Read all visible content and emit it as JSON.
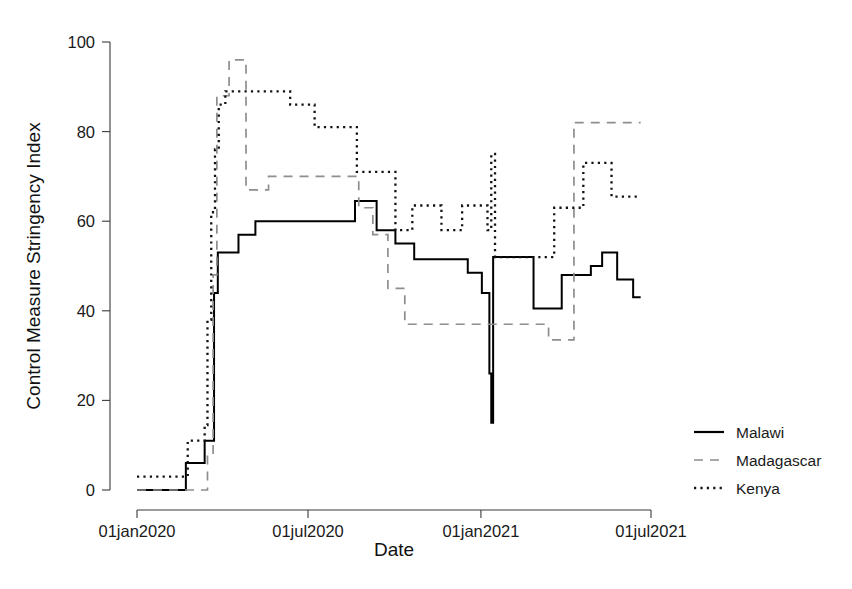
{
  "chart_data": {
    "type": "line",
    "title": "",
    "xlabel": "Date",
    "ylabel": "Control Measure Stringency Index",
    "grid": false,
    "legend_position": "right",
    "xlim": [
      "2020-01-01",
      "2021-07-01"
    ],
    "ylim": [
      0,
      100
    ],
    "xticks": [
      "01jan2020",
      "01jul2020",
      "01jan2021",
      "01jul2021"
    ],
    "xtick_values": [
      "2020-01-01",
      "2020-07-01",
      "2021-01-01",
      "2021-07-01"
    ],
    "yticks": [
      "0",
      "20",
      "40",
      "60",
      "80",
      "100"
    ],
    "ytick_values": [
      0,
      20,
      40,
      60,
      80,
      100
    ],
    "note": "Step (stairstep) lines; values are the index level held from each date until the next date.",
    "series": [
      {
        "name": "Malawi",
        "style": "solid",
        "color": "#000000",
        "points": [
          {
            "x": "2020-01-01",
            "y": 0
          },
          {
            "x": "2020-02-10",
            "y": 0
          },
          {
            "x": "2020-02-22",
            "y": 6
          },
          {
            "x": "2020-03-09",
            "y": 6
          },
          {
            "x": "2020-03-13",
            "y": 11
          },
          {
            "x": "2020-03-20",
            "y": 11
          },
          {
            "x": "2020-03-23",
            "y": 44
          },
          {
            "x": "2020-03-27",
            "y": 53
          },
          {
            "x": "2020-04-10",
            "y": 53
          },
          {
            "x": "2020-04-18",
            "y": 57
          },
          {
            "x": "2020-04-30",
            "y": 57
          },
          {
            "x": "2020-05-06",
            "y": 60
          },
          {
            "x": "2020-08-10",
            "y": 60
          },
          {
            "x": "2020-08-20",
            "y": 64.5
          },
          {
            "x": "2020-09-05",
            "y": 64.5
          },
          {
            "x": "2020-09-12",
            "y": 58
          },
          {
            "x": "2020-09-26",
            "y": 58
          },
          {
            "x": "2020-10-02",
            "y": 55
          },
          {
            "x": "2020-10-16",
            "y": 55
          },
          {
            "x": "2020-10-22",
            "y": 51.5
          },
          {
            "x": "2020-12-10",
            "y": 51.5
          },
          {
            "x": "2020-12-18",
            "y": 48.5
          },
          {
            "x": "2020-12-28",
            "y": 48.5
          },
          {
            "x": "2021-01-02",
            "y": 44
          },
          {
            "x": "2021-01-08",
            "y": 44
          },
          {
            "x": "2021-01-10",
            "y": 26
          },
          {
            "x": "2021-01-12",
            "y": 15
          },
          {
            "x": "2021-01-14",
            "y": 52
          },
          {
            "x": "2021-02-20",
            "y": 52
          },
          {
            "x": "2021-02-26",
            "y": 40.5
          },
          {
            "x": "2021-03-22",
            "y": 40.5
          },
          {
            "x": "2021-03-28",
            "y": 48
          },
          {
            "x": "2021-04-22",
            "y": 48
          },
          {
            "x": "2021-04-28",
            "y": 50
          },
          {
            "x": "2021-05-06",
            "y": 50
          },
          {
            "x": "2021-05-10",
            "y": 53
          },
          {
            "x": "2021-05-22",
            "y": 53
          },
          {
            "x": "2021-05-26",
            "y": 47
          },
          {
            "x": "2021-06-08",
            "y": 47
          },
          {
            "x": "2021-06-12",
            "y": 43
          },
          {
            "x": "2021-06-20",
            "y": 43
          }
        ]
      },
      {
        "name": "Madagascar",
        "style": "dashed",
        "color": "#8e8e8e",
        "points": [
          {
            "x": "2020-01-01",
            "y": 0
          },
          {
            "x": "2020-03-10",
            "y": 0
          },
          {
            "x": "2020-03-16",
            "y": 8
          },
          {
            "x": "2020-03-20",
            "y": 8
          },
          {
            "x": "2020-03-22",
            "y": 48
          },
          {
            "x": "2020-03-26",
            "y": 88
          },
          {
            "x": "2020-04-02",
            "y": 88
          },
          {
            "x": "2020-04-08",
            "y": 96
          },
          {
            "x": "2020-04-20",
            "y": 96
          },
          {
            "x": "2020-04-26",
            "y": 67
          },
          {
            "x": "2020-05-14",
            "y": 67
          },
          {
            "x": "2020-05-20",
            "y": 70
          },
          {
            "x": "2020-08-18",
            "y": 70
          },
          {
            "x": "2020-08-24",
            "y": 63
          },
          {
            "x": "2020-09-02",
            "y": 63
          },
          {
            "x": "2020-09-08",
            "y": 57
          },
          {
            "x": "2020-09-18",
            "y": 57
          },
          {
            "x": "2020-09-24",
            "y": 45
          },
          {
            "x": "2020-10-06",
            "y": 45
          },
          {
            "x": "2020-10-12",
            "y": 37
          },
          {
            "x": "2021-03-06",
            "y": 37
          },
          {
            "x": "2021-03-14",
            "y": 33.5
          },
          {
            "x": "2021-04-04",
            "y": 33.5
          },
          {
            "x": "2021-04-10",
            "y": 82
          },
          {
            "x": "2021-06-20",
            "y": 82
          }
        ]
      },
      {
        "name": "Kenya",
        "style": "dotted",
        "color": "#111111",
        "points": [
          {
            "x": "2020-01-01",
            "y": 3
          },
          {
            "x": "2020-02-18",
            "y": 3
          },
          {
            "x": "2020-02-24",
            "y": 11
          },
          {
            "x": "2020-03-09",
            "y": 11
          },
          {
            "x": "2020-03-13",
            "y": 14.5
          },
          {
            "x": "2020-03-16",
            "y": 38
          },
          {
            "x": "2020-03-20",
            "y": 62
          },
          {
            "x": "2020-03-24",
            "y": 76
          },
          {
            "x": "2020-03-28",
            "y": 86
          },
          {
            "x": "2020-04-04",
            "y": 89
          },
          {
            "x": "2020-06-06",
            "y": 89
          },
          {
            "x": "2020-06-12",
            "y": 86
          },
          {
            "x": "2020-07-02",
            "y": 86
          },
          {
            "x": "2020-07-08",
            "y": 81
          },
          {
            "x": "2020-08-16",
            "y": 81
          },
          {
            "x": "2020-08-22",
            "y": 71
          },
          {
            "x": "2020-09-26",
            "y": 71
          },
          {
            "x": "2020-10-02",
            "y": 58
          },
          {
            "x": "2020-10-14",
            "y": 58
          },
          {
            "x": "2020-10-20",
            "y": 63.5
          },
          {
            "x": "2020-11-14",
            "y": 63.5
          },
          {
            "x": "2020-11-20",
            "y": 58
          },
          {
            "x": "2020-12-06",
            "y": 58
          },
          {
            "x": "2020-12-12",
            "y": 63.5
          },
          {
            "x": "2021-01-02",
            "y": 63.5
          },
          {
            "x": "2021-01-08",
            "y": 58
          },
          {
            "x": "2021-01-12",
            "y": 75
          },
          {
            "x": "2021-01-16",
            "y": 52
          },
          {
            "x": "2021-03-14",
            "y": 52
          },
          {
            "x": "2021-03-20",
            "y": 63
          },
          {
            "x": "2021-04-14",
            "y": 63
          },
          {
            "x": "2021-04-20",
            "y": 73
          },
          {
            "x": "2021-05-14",
            "y": 73
          },
          {
            "x": "2021-05-20",
            "y": 65.5
          },
          {
            "x": "2021-06-20",
            "y": 65.5
          }
        ]
      }
    ]
  },
  "legend": {
    "items": [
      {
        "label": "Malawi",
        "swatch": "solid-line-swatch"
      },
      {
        "label": "Madagascar",
        "swatch": "dashed-line-swatch"
      },
      {
        "label": "Kenya",
        "swatch": "dotted-line-swatch"
      }
    ]
  },
  "axes": {
    "x_title": "Date",
    "y_title": "Control Measure Stringency Index"
  }
}
